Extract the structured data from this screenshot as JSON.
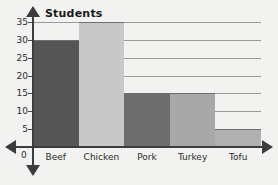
{
  "chart_data": {
    "type": "bar",
    "title": "Students",
    "xlabel": "",
    "ylabel": "",
    "categories": [
      "Beef",
      "Chicken",
      "Pork",
      "Turkey",
      "Tofu"
    ],
    "values": [
      30,
      35,
      15,
      15,
      5
    ],
    "bar_colors": [
      "#555555",
      "#c8c8c8",
      "#6e6e6e",
      "#a8a8a8",
      "#b0b0b0"
    ],
    "ylim": [
      0,
      35
    ],
    "ytick_labels": [
      "0",
      "5",
      "10",
      "15",
      "20",
      "25",
      "30",
      "35"
    ],
    "ytick_values": [
      0,
      5,
      10,
      15,
      20,
      25,
      30,
      35
    ],
    "grid": true,
    "legend": "none",
    "origin_label": "0",
    "axis_color": "#3c3c3c",
    "gridline_color": "#9a9a98",
    "background_color": "#f2f2f0"
  }
}
